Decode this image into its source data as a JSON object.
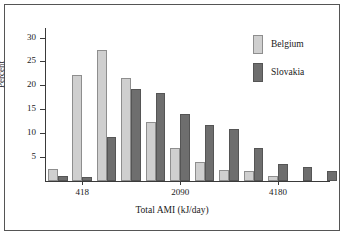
{
  "chart_data": {
    "type": "bar",
    "title": "",
    "xlabel": "Total AMI (kJ/day)",
    "ylabel": "Percent",
    "ylim": [
      0,
      32
    ],
    "yticks": [
      5,
      10,
      15,
      20,
      25,
      30
    ],
    "ytick_labels": [
      "5",
      "10",
      "15",
      "20",
      "25",
      "30"
    ],
    "grid": false,
    "legend_position": "top-right",
    "xtick_labels": [
      "418",
      "2090",
      "4180"
    ],
    "xtick_bins": [
      1,
      5,
      9
    ],
    "categories": [
      "bin1",
      "bin2",
      "bin3",
      "bin4",
      "bin5",
      "bin6",
      "bin7",
      "bin8",
      "bin9",
      "bin10",
      "bin11"
    ],
    "series": [
      {
        "name": "Belgium",
        "color": "#cfcfcf",
        "values": [
          2.6,
          22.2,
          27.5,
          21.6,
          12.3,
          7.0,
          3.9,
          2.4,
          2.0,
          1.1,
          0.0
        ]
      },
      {
        "name": "Slovakia",
        "color": "#6e6e6e",
        "values": [
          1.0,
          0.8,
          9.3,
          19.3,
          18.5,
          14.1,
          11.7,
          10.8,
          7.0,
          3.5,
          3.0
        ]
      }
    ],
    "extra_bar": {
      "name": "Slovakia",
      "value": 2.1,
      "note": "final rightmost Slovakia bar"
    }
  },
  "legend": {
    "items": [
      {
        "label": "Belgium",
        "swatch": "belgium-swatch"
      },
      {
        "label": "Slovakia",
        "swatch": "slovakia-swatch"
      }
    ]
  },
  "axes": {
    "y_title": "Percent",
    "x_title": "Total AMI (kJ/day)"
  }
}
